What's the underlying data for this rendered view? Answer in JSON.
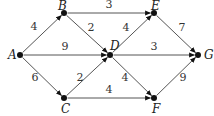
{
  "diagram": {
    "type": "weighted directed graph",
    "nodes": [
      {
        "id": "A",
        "label": "A",
        "x": 20,
        "y": 55
      },
      {
        "id": "B",
        "label": "B",
        "x": 64,
        "y": 13
      },
      {
        "id": "C",
        "label": "C",
        "x": 64,
        "y": 98
      },
      {
        "id": "D",
        "label": "D",
        "x": 110,
        "y": 55
      },
      {
        "id": "E",
        "label": "E",
        "x": 154,
        "y": 13
      },
      {
        "id": "F",
        "label": "F",
        "x": 154,
        "y": 98
      },
      {
        "id": "G",
        "label": "G",
        "x": 198,
        "y": 55
      }
    ],
    "edges": [
      {
        "from": "A",
        "to": "B",
        "weight": "4"
      },
      {
        "from": "A",
        "to": "D",
        "weight": "9"
      },
      {
        "from": "A",
        "to": "C",
        "weight": "6"
      },
      {
        "from": "B",
        "to": "E",
        "weight": "3"
      },
      {
        "from": "B",
        "to": "D",
        "weight": "2"
      },
      {
        "from": "C",
        "to": "D",
        "weight": "2"
      },
      {
        "from": "C",
        "to": "F",
        "weight": "4"
      },
      {
        "from": "D",
        "to": "E",
        "weight": "4"
      },
      {
        "from": "D",
        "to": "G",
        "weight": "3"
      },
      {
        "from": "D",
        "to": "F",
        "weight": "4"
      },
      {
        "from": "E",
        "to": "G",
        "weight": "7"
      },
      {
        "from": "F",
        "to": "G",
        "weight": "9"
      }
    ]
  }
}
